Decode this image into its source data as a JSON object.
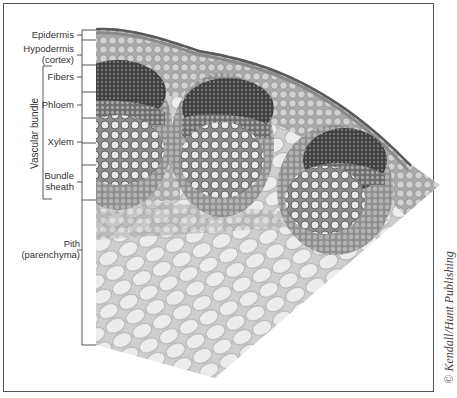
{
  "figure": {
    "labels": {
      "epidermis": "Epidermis",
      "hypodermis_line1": "Hypodermis",
      "hypodermis_line2": "(cortex)",
      "fibers": "Fibers",
      "phloem": "Phloem",
      "xylem": "Xylem",
      "bundle_sheath_line1": "Bundle",
      "bundle_sheath_line2": "sheath",
      "pith_line1": "Pith",
      "pith_line2": "(parenchyma)",
      "vascular_bundle": "Vascular bundle"
    },
    "credit": "© Kendall/Hunt Publishing",
    "colors": {
      "epidermis": "#6e6e6e",
      "cortex": "#b8b8b8",
      "fibers": "#4a4a4a",
      "phloem": "#8a8a8a",
      "xylem": "#d8d8d8",
      "sheath": "#a0a0a0",
      "pith": "#e6e6e6",
      "cell_wall": "#8c8c8c"
    }
  }
}
